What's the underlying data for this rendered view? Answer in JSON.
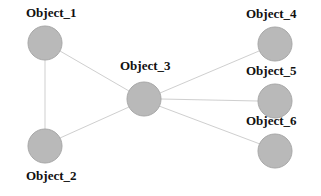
{
  "diagram": {
    "type": "node-link-graph",
    "width": 321,
    "height": 196,
    "background_color": "#ffffff",
    "node_fill_color": "#b9b9b9",
    "node_stroke_color": "#a8a8a8",
    "edge_color": "#cfcfcf",
    "edge_width": 1,
    "node_radius": 17,
    "label_color": "#111111",
    "nodes": [
      {
        "id": "object_1",
        "label": "Object_1",
        "cx": 45,
        "cy": 43,
        "r": 17,
        "label_x": 26,
        "label_y": 6
      },
      {
        "id": "object_2",
        "label": "Object_2",
        "cx": 45,
        "cy": 146,
        "r": 17,
        "label_x": 26,
        "label_y": 169
      },
      {
        "id": "object_3",
        "label": "Object_3",
        "cx": 144,
        "cy": 99,
        "r": 17,
        "label_x": 120,
        "label_y": 59
      },
      {
        "id": "object_4",
        "label": "Object_4",
        "cx": 275,
        "cy": 44,
        "r": 17,
        "label_x": 246,
        "label_y": 7
      },
      {
        "id": "object_5",
        "label": "Object_5",
        "cx": 275,
        "cy": 101,
        "r": 17,
        "label_x": 246,
        "label_y": 64
      },
      {
        "id": "object_6",
        "label": "Object_6",
        "cx": 275,
        "cy": 151,
        "r": 17,
        "label_x": 246,
        "label_y": 114
      }
    ],
    "edges": [
      {
        "id": "edge-1-2",
        "source": "object_1",
        "target": "object_2",
        "x1": 45,
        "y1": 60,
        "x2": 45,
        "y2": 129
      },
      {
        "id": "edge-1-3",
        "source": "object_1",
        "target": "object_3",
        "x1": 60,
        "y1": 51,
        "x2": 129,
        "y2": 91
      },
      {
        "id": "edge-2-3",
        "source": "object_2",
        "target": "object_3",
        "x1": 60,
        "y1": 138,
        "x2": 129,
        "y2": 107
      },
      {
        "id": "edge-3-4",
        "source": "object_3",
        "target": "object_4",
        "x1": 160,
        "y1": 93,
        "x2": 259,
        "y2": 51
      },
      {
        "id": "edge-3-5",
        "source": "object_3",
        "target": "object_5",
        "x1": 161,
        "y1": 99,
        "x2": 258,
        "y2": 101
      },
      {
        "id": "edge-3-6",
        "source": "object_3",
        "target": "object_6",
        "x1": 159,
        "y1": 106,
        "x2": 260,
        "y2": 144
      }
    ]
  }
}
